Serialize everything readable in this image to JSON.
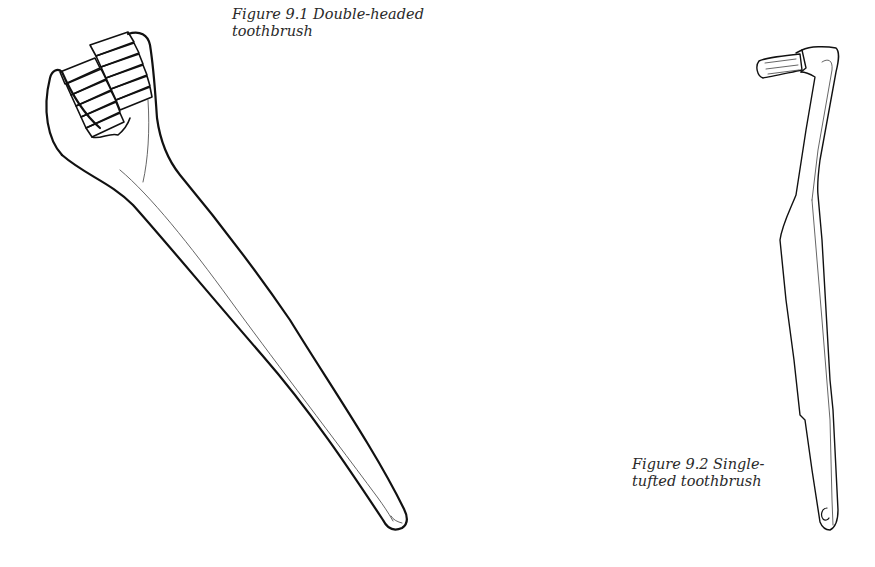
{
  "figures": [
    {
      "id": "9.1",
      "caption": {
        "lines": [
          "Figure 9.1  Double-headed",
          "toothbrush"
        ]
      },
      "illustration": "double-headed-toothbrush"
    },
    {
      "id": "9.2",
      "caption": {
        "lines": [
          "Figure 9.2  Single-",
          "tufted toothbrush"
        ]
      },
      "illustration": "single-tufted-toothbrush"
    }
  ],
  "colors": {
    "ink": "#111111",
    "caption_text": "#2a2a2a",
    "background": "#ffffff"
  }
}
